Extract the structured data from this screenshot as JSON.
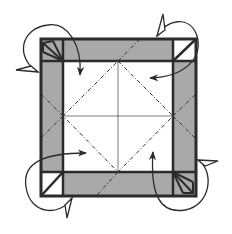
{
  "diagram": {
    "type": "origami-crease-pattern-step",
    "colors": {
      "background": "#ffffff",
      "paper_colored": "#a9a9a9",
      "paper_white": "#ffffff",
      "line": "#2b2b2b"
    },
    "square": {
      "x1": 41,
      "y1": 39,
      "x2": 196,
      "y2": 196
    },
    "inner_square": {
      "x1": 63,
      "y1": 61,
      "x2": 173,
      "y2": 172
    },
    "corners": [
      {
        "position": "top-left",
        "style": "fan-fold"
      },
      {
        "position": "top-right",
        "style": "white-diagonal"
      },
      {
        "position": "bottom-left",
        "style": "white-diagonal"
      },
      {
        "position": "bottom-right",
        "style": "fan-fold"
      }
    ],
    "crease_lines": [
      {
        "type": "mountain-dash-dot",
        "description": "diamond connecting inner-square midpoints"
      },
      {
        "type": "thin-solid",
        "description": "vertical and horizontal center lines"
      }
    ],
    "arrows": [
      {
        "name": "top-left-fold-arrow",
        "direction": "down"
      },
      {
        "name": "top-right-fold-arrow",
        "direction": "left"
      },
      {
        "name": "bottom-left-fold-arrow",
        "direction": "right"
      },
      {
        "name": "bottom-right-fold-arrow",
        "direction": "up"
      }
    ]
  }
}
